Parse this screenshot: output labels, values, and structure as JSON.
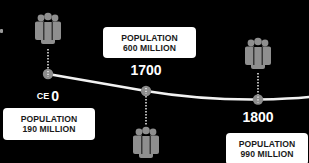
{
  "diagram": {
    "type": "timeline",
    "title": "",
    "colors": {
      "background": "#000000",
      "line": "#f2f2f2",
      "node": "#8c8c8c",
      "icon": "#8f8f8f",
      "box": "#ffffff",
      "box_text": "#1a1a1a",
      "year_text": "#ffffff"
    },
    "events": [
      {
        "year_prefix": "CE",
        "year": "0",
        "population_label": "POPULATION",
        "population_value": "190 MILLION",
        "icon": "people-group-icon",
        "icon_position": "above"
      },
      {
        "year_prefix": "",
        "year": "1700",
        "population_label": "POPULATION",
        "population_value": "600 MILLION",
        "icon": "people-group-icon",
        "icon_position": "below"
      },
      {
        "year_prefix": "",
        "year": "1800",
        "population_label": "POPULATION",
        "population_value": "990 MILLION",
        "icon": "people-group-icon",
        "icon_position": "above"
      }
    ]
  }
}
